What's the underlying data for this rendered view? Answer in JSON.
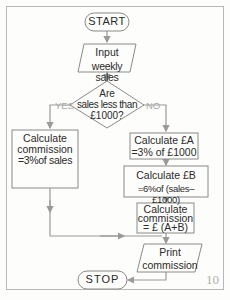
{
  "flowchart": {
    "start": "START",
    "input": [
      "Input",
      "weekly sales"
    ],
    "decision": [
      "Are",
      "sales less than",
      "£1000?"
    ],
    "yes_label": "YES",
    "no_label": "NO",
    "yes_box": [
      "Calculate",
      "commission",
      "=3%of sales"
    ],
    "calc_a": [
      "Calculate £A",
      "=3% of £1000"
    ],
    "calc_b": [
      "Calculate £B",
      "=6%of (sales–£1000)"
    ],
    "calc_comm": [
      "Calculate",
      "commission",
      "= £ (A+B)"
    ],
    "print": [
      "Print",
      "commission"
    ],
    "stop": "STOP"
  },
  "page_number": "10",
  "colors": {
    "line": "#9a9a9a",
    "box": "#8a8a8a",
    "text": "#2a2a2a",
    "edge_label": "#a8a8a8"
  }
}
